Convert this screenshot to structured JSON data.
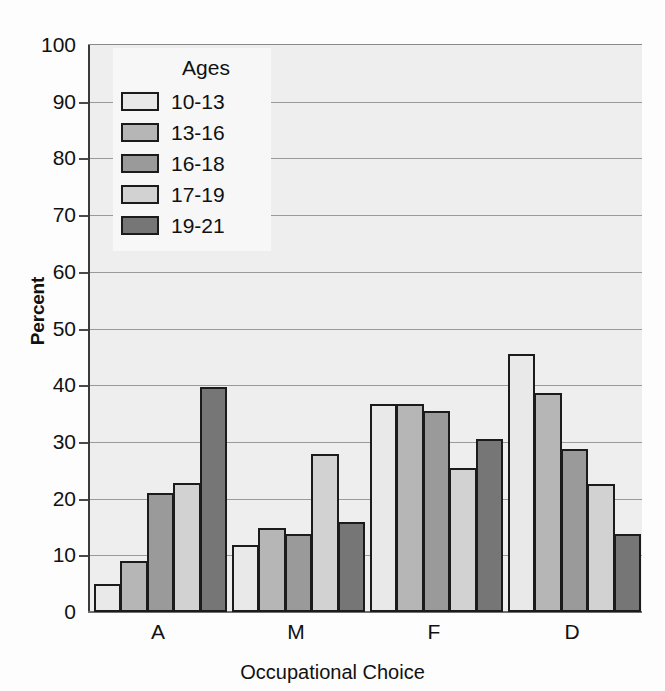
{
  "chart_data": {
    "type": "bar",
    "title": "",
    "xlabel": "Occupational Choice",
    "ylabel": "Percent",
    "categories": [
      "A",
      "M",
      "F",
      "D"
    ],
    "ylim": [
      0,
      100
    ],
    "yticks": [
      0,
      10,
      20,
      30,
      40,
      50,
      60,
      70,
      80,
      90,
      100
    ],
    "grid": true,
    "legend_title": "Ages",
    "legend_position": "upper-left-inside",
    "series": [
      {
        "name": "10-13",
        "color": "#e9e9e9",
        "values": [
          5.0,
          11.8,
          36.6,
          45.5
        ]
      },
      {
        "name": "13-16",
        "color": "#b6b6b6",
        "values": [
          9.0,
          14.8,
          36.6,
          38.6
        ]
      },
      {
        "name": "16-18",
        "color": "#9a9a9a",
        "values": [
          21.0,
          13.8,
          35.5,
          28.7
        ]
      },
      {
        "name": "17-19",
        "color": "#d2d2d2",
        "values": [
          22.7,
          27.8,
          25.4,
          22.6
        ]
      },
      {
        "name": "19-21",
        "color": "#767676",
        "values": [
          39.7,
          15.8,
          30.6,
          13.7
        ]
      }
    ]
  },
  "axes": {
    "ytick_labels": [
      "0",
      "10",
      "20",
      "30",
      "40",
      "50",
      "60",
      "70",
      "80",
      "90",
      "100"
    ],
    "xtick_labels": [
      "A",
      "M",
      "F",
      "D"
    ],
    "ylabel_text": "Percent",
    "xlabel_text": "Occupational Choice"
  },
  "legend": {
    "title": "Ages",
    "items": [
      {
        "label": "10-13"
      },
      {
        "label": "13-16"
      },
      {
        "label": "16-18"
      },
      {
        "label": "17-19"
      },
      {
        "label": "19-21"
      }
    ]
  }
}
